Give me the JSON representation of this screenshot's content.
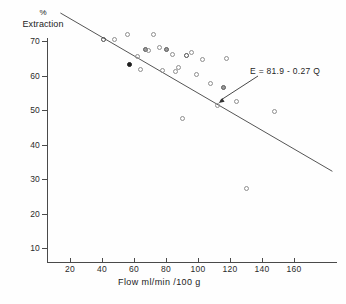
{
  "chart_data": {
    "type": "scatter",
    "title": "",
    "xlabel": "Flow  ml/min /100 g",
    "ylabel_line1": "%",
    "ylabel_line2": "Extraction",
    "xlim": [
      0,
      185
    ],
    "ylim": [
      5,
      76
    ],
    "grid": false,
    "legend": "none",
    "xticks": [
      20,
      40,
      60,
      80,
      100,
      120,
      140,
      160
    ],
    "yticks": [
      10,
      20,
      30,
      40,
      50,
      60,
      70
    ],
    "xtick_labels": [
      "20",
      "40",
      "60",
      "80",
      "100",
      "120",
      "140",
      "160"
    ],
    "ytick_labels": [
      "10",
      "20",
      "30",
      "40",
      "50",
      "60",
      "70"
    ],
    "annotation": {
      "text": "E = 81.9 - 0.27 Q",
      "points_to_x": 112,
      "points_to_y": 51.6
    },
    "fit": {
      "equation": "E = 81.9 - 0.27 Q",
      "intercept": 81.9,
      "slope": -0.27,
      "x_start": 14,
      "x_end": 184
    },
    "series": [
      {
        "name": "observations",
        "marker": "open-circle",
        "points": [
          {
            "x": 41,
            "y": 70.5,
            "style": "dark"
          },
          {
            "x": 48,
            "y": 70.4,
            "style": "open"
          },
          {
            "x": 56,
            "y": 71.8,
            "style": "open"
          },
          {
            "x": 57,
            "y": 63.2,
            "style": "filled"
          },
          {
            "x": 62,
            "y": 65.6,
            "style": "open"
          },
          {
            "x": 64,
            "y": 61.6,
            "style": "open"
          },
          {
            "x": 67,
            "y": 67.4,
            "style": "semi"
          },
          {
            "x": 69,
            "y": 67.2,
            "style": "open"
          },
          {
            "x": 72,
            "y": 72.0,
            "style": "open"
          },
          {
            "x": 76,
            "y": 68.2,
            "style": "open"
          },
          {
            "x": 78,
            "y": 61.4,
            "style": "open"
          },
          {
            "x": 80,
            "y": 67.6,
            "style": "semi"
          },
          {
            "x": 84,
            "y": 66.0,
            "style": "open"
          },
          {
            "x": 86,
            "y": 61.3,
            "style": "open"
          },
          {
            "x": 88,
            "y": 62.4,
            "style": "open"
          },
          {
            "x": 90,
            "y": 47.6,
            "style": "open"
          },
          {
            "x": 93,
            "y": 65.9,
            "style": "dark"
          },
          {
            "x": 96,
            "y": 66.8,
            "style": "open"
          },
          {
            "x": 99,
            "y": 60.2,
            "style": "open"
          },
          {
            "x": 103,
            "y": 64.7,
            "style": "open"
          },
          {
            "x": 108,
            "y": 57.6,
            "style": "open"
          },
          {
            "x": 112,
            "y": 51.4,
            "style": "open"
          },
          {
            "x": 116,
            "y": 56.6,
            "style": "semi"
          },
          {
            "x": 118,
            "y": 64.9,
            "style": "open"
          },
          {
            "x": 124,
            "y": 52.4,
            "style": "open"
          },
          {
            "x": 130,
            "y": 27.2,
            "style": "open"
          },
          {
            "x": 148,
            "y": 49.6,
            "style": "open"
          }
        ]
      }
    ]
  }
}
